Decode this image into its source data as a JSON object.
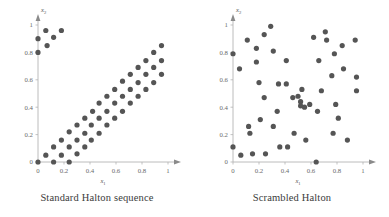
{
  "figure": {
    "background": "#ffffff",
    "dot_color": "#555555",
    "axis_color": "#b4b4b4",
    "tick_label_color": "#6b6b6b"
  },
  "panels": [
    {
      "id": "standard-halton",
      "caption": "Standard Halton sequence",
      "xlabel": "x",
      "xlabel_sub": "1",
      "ylabel": "x",
      "ylabel_sub": "2"
    },
    {
      "id": "scrambled-halton",
      "caption": "Scrambled Halton",
      "xlabel": "x",
      "xlabel_sub": "1",
      "ylabel": "x",
      "ylabel_sub": "2"
    }
  ],
  "chart_data": [
    {
      "type": "scatter",
      "title": "Standard Halton sequence",
      "xlabel": "x1",
      "ylabel": "x2",
      "xlim": [
        0,
        1
      ],
      "ylim": [
        0,
        1
      ],
      "xticks": [
        0,
        0.2,
        0.4,
        0.6,
        0.8,
        1
      ],
      "yticks": [
        0,
        0.2,
        0.4,
        0.6,
        0.8,
        1
      ],
      "xticklabels": [
        "0",
        "0.2",
        "0.4",
        "0.6",
        "0.8",
        "1"
      ],
      "yticklabels": [
        "0",
        "0.2",
        "0.4",
        "0.6",
        "0.8",
        "1"
      ],
      "grid": false,
      "legend": null,
      "marker": "circle",
      "marker_size": 2.6,
      "color": "#555555",
      "points": [
        [
          0.0,
          0.8
        ],
        [
          0.0,
          0.9
        ],
        [
          0.06,
          0.96
        ],
        [
          0.07,
          0.85
        ],
        [
          0.12,
          0.91
        ],
        [
          0.18,
          0.96
        ],
        [
          0.0,
          0.0
        ],
        [
          0.06,
          0.05
        ],
        [
          0.12,
          0.11
        ],
        [
          0.18,
          0.16
        ],
        [
          0.24,
          0.22
        ],
        [
          0.3,
          0.27
        ],
        [
          0.36,
          0.32
        ],
        [
          0.42,
          0.37
        ],
        [
          0.47,
          0.43
        ],
        [
          0.53,
          0.48
        ],
        [
          0.59,
          0.53
        ],
        [
          0.65,
          0.59
        ],
        [
          0.71,
          0.64
        ],
        [
          0.77,
          0.69
        ],
        [
          0.83,
          0.74
        ],
        [
          0.89,
          0.8
        ],
        [
          0.95,
          0.85
        ],
        [
          0.12,
          0.0
        ],
        [
          0.18,
          0.05
        ],
        [
          0.24,
          0.11
        ],
        [
          0.3,
          0.16
        ],
        [
          0.36,
          0.21
        ],
        [
          0.41,
          0.27
        ],
        [
          0.47,
          0.32
        ],
        [
          0.53,
          0.37
        ],
        [
          0.59,
          0.43
        ],
        [
          0.65,
          0.48
        ],
        [
          0.71,
          0.53
        ],
        [
          0.77,
          0.58
        ],
        [
          0.83,
          0.64
        ],
        [
          0.89,
          0.69
        ],
        [
          0.95,
          0.74
        ],
        [
          0.24,
          0.0
        ],
        [
          0.3,
          0.06
        ],
        [
          0.36,
          0.11
        ],
        [
          0.41,
          0.16
        ],
        [
          0.47,
          0.21
        ],
        [
          0.53,
          0.27
        ],
        [
          0.59,
          0.32
        ],
        [
          0.65,
          0.37
        ],
        [
          0.71,
          0.43
        ],
        [
          0.77,
          0.48
        ],
        [
          0.83,
          0.53
        ],
        [
          0.89,
          0.58
        ],
        [
          0.95,
          0.64
        ]
      ]
    },
    {
      "type": "scatter",
      "title": "Scrambled Halton",
      "xlabel": "x1",
      "ylabel": "x2",
      "xlim": [
        0,
        1
      ],
      "ylim": [
        0,
        1
      ],
      "xticks": [
        0,
        0.2,
        0.4,
        0.6,
        0.8,
        1
      ],
      "yticks": [
        0,
        0.2,
        0.4,
        0.6,
        0.8,
        1
      ],
      "xticklabels": [
        "0",
        "0.2",
        "0.4",
        "0.6",
        "0.8",
        "1"
      ],
      "yticklabels": [
        "0",
        "0.2",
        "0.4",
        "0.6",
        "0.8",
        "1"
      ],
      "grid": false,
      "legend": null,
      "marker": "circle",
      "marker_size": 2.6,
      "color": "#555555",
      "points": [
        [
          0.0,
          0.79
        ],
        [
          0.0,
          0.11
        ],
        [
          0.06,
          0.05
        ],
        [
          0.05,
          0.68
        ],
        [
          0.11,
          0.89
        ],
        [
          0.12,
          0.26
        ],
        [
          0.13,
          0.21
        ],
        [
          0.15,
          0.06
        ],
        [
          0.18,
          0.83
        ],
        [
          0.18,
          0.73
        ],
        [
          0.2,
          0.58
        ],
        [
          0.21,
          0.31
        ],
        [
          0.24,
          0.93
        ],
        [
          0.24,
          0.47
        ],
        [
          0.25,
          0.06
        ],
        [
          0.29,
          0.99
        ],
        [
          0.31,
          0.81
        ],
        [
          0.31,
          0.26
        ],
        [
          0.34,
          0.37
        ],
        [
          0.35,
          0.57
        ],
        [
          0.36,
          0.11
        ],
        [
          0.41,
          0.74
        ],
        [
          0.41,
          0.57
        ],
        [
          0.42,
          0.11
        ],
        [
          0.46,
          0.47
        ],
        [
          0.47,
          0.21
        ],
        [
          0.5,
          0.48
        ],
        [
          0.52,
          0.44
        ],
        [
          0.52,
          0.41
        ],
        [
          0.53,
          0.53
        ],
        [
          0.55,
          0.4
        ],
        [
          0.56,
          0.16
        ],
        [
          0.59,
          0.42
        ],
        [
          0.62,
          0.91
        ],
        [
          0.64,
          0.0
        ],
        [
          0.65,
          0.37
        ],
        [
          0.66,
          0.74
        ],
        [
          0.68,
          0.52
        ],
        [
          0.71,
          0.95
        ],
        [
          0.72,
          0.89
        ],
        [
          0.76,
          0.63
        ],
        [
          0.77,
          0.21
        ],
        [
          0.78,
          0.79
        ],
        [
          0.79,
          0.42
        ],
        [
          0.81,
          0.32
        ],
        [
          0.84,
          0.85
        ],
        [
          0.85,
          0.68
        ],
        [
          0.88,
          0.16
        ],
        [
          0.94,
          0.89
        ],
        [
          0.95,
          0.62
        ],
        [
          0.95,
          0.52
        ]
      ]
    }
  ]
}
